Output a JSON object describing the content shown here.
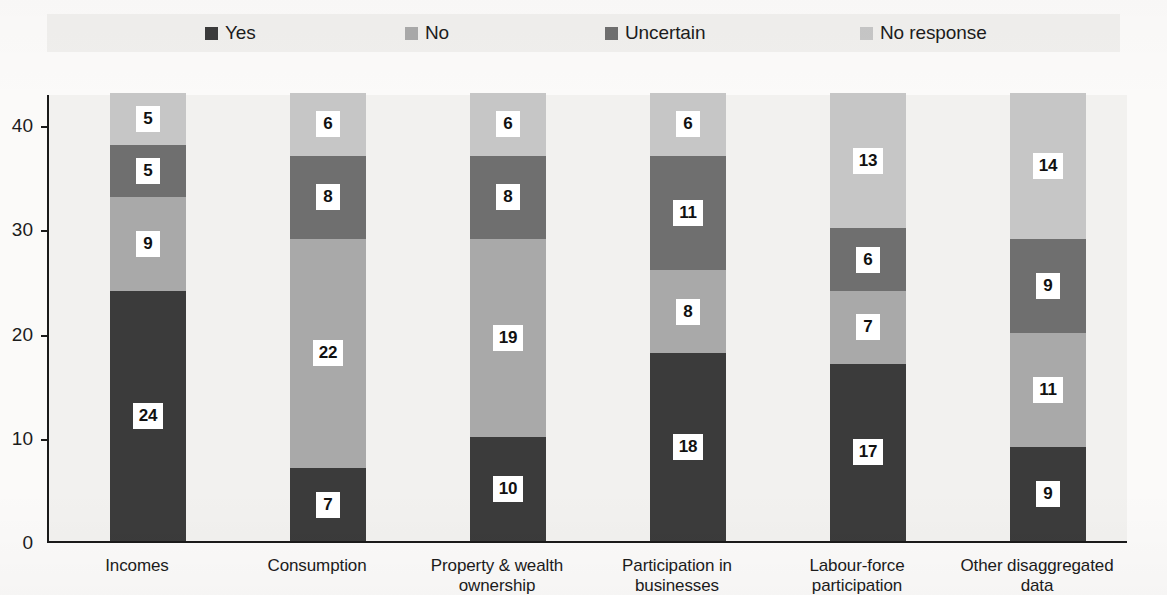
{
  "chart_data": {
    "type": "bar",
    "subtype": "stacked-bar-vertical",
    "title": "",
    "subtitle": "",
    "xlabel": "",
    "ylabel": "",
    "ylim": [
      0,
      43
    ],
    "yticks": [
      0,
      10,
      20,
      30,
      40
    ],
    "ytick_labels": [
      "0",
      "10",
      "20",
      "30",
      "40"
    ],
    "grid": false,
    "legend_position": "top",
    "stack_order": "bottom-to-top",
    "categories": [
      "Incomes",
      "Consumption",
      "Property & wealth ownership",
      "Participation in businesses",
      "Labour-force participation",
      "Other disaggregated data"
    ],
    "category_lines": [
      [
        "Incomes"
      ],
      [
        "Consumption"
      ],
      [
        "Property & wealth",
        "ownership"
      ],
      [
        "Participation in businesses"
      ],
      [
        "Labour-force",
        "participation"
      ],
      [
        "Other disaggregated",
        "data"
      ]
    ],
    "series": [
      {
        "name": "Yes",
        "color": "#3b3b3b",
        "values": [
          24,
          7,
          10,
          18,
          17,
          9
        ]
      },
      {
        "name": "No",
        "color": "#a9a9a9",
        "values": [
          9,
          22,
          19,
          8,
          7,
          11
        ]
      },
      {
        "name": "Uncertain",
        "color": "#6f6f6f",
        "values": [
          5,
          8,
          8,
          11,
          6,
          9
        ]
      },
      {
        "name": "No response",
        "color": "#c6c6c6",
        "values": [
          5,
          6,
          6,
          6,
          13,
          14
        ]
      }
    ],
    "totals": [
      43,
      43,
      43,
      43,
      43,
      43
    ]
  },
  "legend": {
    "items": [
      {
        "label": "Yes",
        "color": "#3b3b3b"
      },
      {
        "label": "No",
        "color": "#a9a9a9"
      },
      {
        "label": "Uncertain",
        "color": "#6f6f6f"
      },
      {
        "label": "No response",
        "color": "#c6c6c6"
      }
    ]
  },
  "axis": {
    "y_tick_labels": [
      "40",
      "30",
      "20",
      "10",
      "0"
    ]
  }
}
